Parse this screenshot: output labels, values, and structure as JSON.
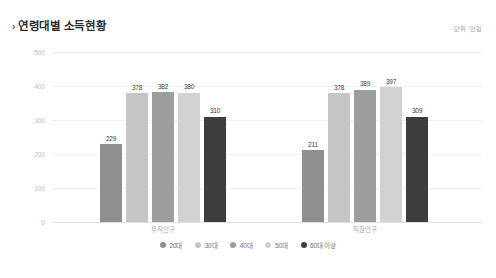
{
  "header": {
    "chevron": "›",
    "title": "연령대별 소득현황",
    "unit_note": "단위 : 만원"
  },
  "chart_data": {
    "type": "bar",
    "title": "연령대별 소득현황",
    "xlabel": "",
    "ylabel": "",
    "unit": "만원",
    "ylim": [
      0,
      500
    ],
    "yticks": [
      500,
      400,
      300,
      200,
      100,
      0
    ],
    "grid": true,
    "legend_position": "bottom",
    "categories": [
      "무직인구",
      "직장인구"
    ],
    "series": [
      {
        "name": "20대",
        "color": "#8d8f91",
        "values": [
          229,
          211
        ]
      },
      {
        "name": "30대",
        "color": "#c3c5c6",
        "values": [
          378,
          378
        ]
      },
      {
        "name": "40대",
        "color": "#9b9d9f",
        "values": [
          382,
          389
        ]
      },
      {
        "name": "50대",
        "color": "#d0d2d3",
        "values": [
          380,
          397
        ]
      },
      {
        "name": "60대 이상",
        "color": "#3b3d3f",
        "values": [
          310,
          309
        ]
      }
    ]
  }
}
